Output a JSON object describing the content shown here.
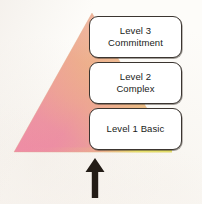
{
  "diagram": {
    "pyramid": {
      "name": "gradient-pyramid",
      "apex": {
        "x": 92,
        "y": 13
      },
      "base_left": {
        "x": 14,
        "y": 152
      },
      "base_right": {
        "x": 172,
        "y": 152
      },
      "gradient": {
        "apex_color": "#e8a878",
        "upper_right_color": "#efc39b",
        "mid_color": "#eaa89b",
        "lower_left_color": "#e87fa2",
        "base_left_color": "#ef8fae",
        "base_right_color": "#e2e06a"
      }
    },
    "levels": [
      {
        "id": "level-3",
        "position": "top",
        "lines": [
          "Level 3",
          "Commitment"
        ],
        "line1": "Level 3",
        "line2": "Commitment",
        "border_color": "#3b3530",
        "fill_color": "#ffffff"
      },
      {
        "id": "level-2",
        "position": "middle",
        "lines": [
          "Level 2",
          "Complex"
        ],
        "line1": "Level 2",
        "line2": "Complex",
        "border_color": "#3b3530",
        "fill_color": "#ffffff"
      },
      {
        "id": "level-1",
        "position": "bottom",
        "lines": [
          "Level 1 Basic"
        ],
        "line1": "Level 1 Basic",
        "line2": "",
        "border_color": "#3b3530",
        "fill_color": "#ffffff"
      }
    ],
    "arrow": {
      "name": "upward-arrow",
      "direction": "up",
      "color": "#231c16"
    },
    "background_color": "#fdfcf9"
  }
}
